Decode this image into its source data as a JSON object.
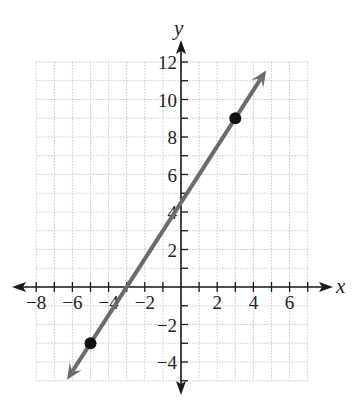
{
  "chart_data": {
    "type": "line",
    "title": "",
    "xlabel": "x",
    "ylabel": "y",
    "xlim": [
      -8,
      7
    ],
    "ylim": [
      -5,
      12
    ],
    "grid": true,
    "x_ticks": [
      -8,
      -6,
      -4,
      -2,
      2,
      4,
      6
    ],
    "y_ticks": [
      -4,
      -2,
      2,
      4,
      6,
      8,
      10,
      12
    ],
    "series": [
      {
        "name": "line",
        "equation": "y = 1.5x + 4.5",
        "slope": 1.5,
        "intercept": 4.5,
        "x": [
          -6.3,
          4.7
        ],
        "y": [
          -4.95,
          11.55
        ],
        "arrows_both_ends": true,
        "color": "#6b6b6b"
      }
    ],
    "points": [
      {
        "x": 3,
        "y": 9
      },
      {
        "x": -5,
        "y": -3
      }
    ]
  },
  "labels": {
    "x_axis": "x",
    "y_axis": "y",
    "x_tick_labels": [
      "−8",
      "−6",
      "−4",
      "−2",
      "2",
      "4",
      "6"
    ],
    "y_tick_labels": [
      "12",
      "10",
      "8",
      "6",
      "4",
      "2",
      "−2",
      "−4"
    ]
  },
  "colors": {
    "grid": "#c8c8c8",
    "axis": "#1a1a1a",
    "line": "#6b6b6b",
    "point": "#111111"
  }
}
